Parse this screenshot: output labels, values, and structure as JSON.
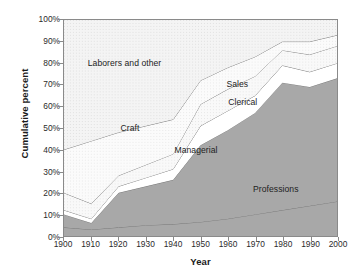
{
  "chart_data": {
    "type": "area",
    "title": "",
    "xlabel": "Year",
    "ylabel": "Cumulative percent",
    "x": [
      1900,
      1910,
      1920,
      1930,
      1940,
      1950,
      1960,
      1970,
      1980,
      1990,
      2000
    ],
    "xlim": [
      1900,
      2000
    ],
    "ylim": [
      0,
      100
    ],
    "grid": false,
    "legend_position": "inline-annotations",
    "xtick_labels": [
      "1900",
      "1910",
      "1920",
      "1930",
      "1940",
      "1950",
      "1960",
      "1970",
      "1980",
      "1990",
      "2000"
    ],
    "ytick_labels": [
      "0%",
      "10%",
      "20%",
      "30%",
      "40%",
      "50%",
      "60%",
      "70%",
      "80%",
      "90%",
      "100%"
    ],
    "stacking": "cumulative-from-bottom",
    "series": [
      {
        "name": "Professions",
        "fill": "#a8a8a8",
        "cumulative_top": [
          4,
          3,
          4,
          5,
          5.5,
          6.5,
          8,
          10,
          12,
          14,
          16
        ],
        "label_position": {
          "x": 1977,
          "y": 22
        }
      },
      {
        "name": "Managerial",
        "fill": "#a8a8a8",
        "cumulative_top": [
          10,
          6,
          20,
          23,
          26,
          42,
          49,
          57,
          71,
          69,
          73
        ],
        "label_position": {
          "x": 1948,
          "y": 40
        }
      },
      {
        "name": "Clerical",
        "fill": "#ffffff",
        "cumulative_top": [
          12,
          8,
          23,
          27,
          31,
          51,
          58,
          65,
          79,
          76,
          80
        ],
        "label_position": {
          "x": 1965,
          "y": 62
        }
      },
      {
        "name": "Sales",
        "fill": "#f2f2f2",
        "cumulative_top": [
          20,
          15,
          28,
          33,
          38,
          61,
          68,
          74,
          86,
          84,
          88
        ],
        "label_position": {
          "x": 1963,
          "y": 70
        }
      },
      {
        "name": "Craft",
        "fill": "#f7f7f7",
        "cumulative_top": [
          40,
          44,
          48,
          51,
          54,
          72,
          78,
          83,
          90,
          90,
          93
        ],
        "label_position": {
          "x": 1924,
          "y": 50
        }
      },
      {
        "name": "Laborers and other",
        "fill": "#e6e6e6",
        "cumulative_top": [
          100,
          100,
          100,
          100,
          100,
          100,
          100,
          100,
          100,
          100,
          100
        ],
        "label_position": {
          "x": 1922,
          "y": 80
        }
      }
    ],
    "annotations": [
      {
        "text": "Laborers and other",
        "x": 1922,
        "y": 80
      },
      {
        "text": "Craft",
        "x": 1924,
        "y": 50
      },
      {
        "text": "Sales",
        "x": 1963,
        "y": 70
      },
      {
        "text": "Clerical",
        "x": 1965,
        "y": 62
      },
      {
        "text": "Managerial",
        "x": 1948,
        "y": 40
      },
      {
        "text": "Professions",
        "x": 1977,
        "y": 22
      }
    ],
    "colors": {
      "axis": "#8a8a8a",
      "text": "#1d1d1d",
      "line": "#7a7a7a",
      "background": "#ffffff"
    }
  }
}
